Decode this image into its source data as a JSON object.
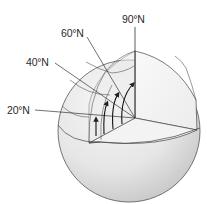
{
  "figure": {
    "labels": [
      {
        "id": "lat-90",
        "text": "90°N",
        "x": 122,
        "y": 14
      },
      {
        "id": "lat-60",
        "text": "60°N",
        "x": 61,
        "y": 28
      },
      {
        "id": "lat-40",
        "text": "40°N",
        "x": 26,
        "y": 57
      },
      {
        "id": "lat-20",
        "text": "20°N",
        "x": 7,
        "y": 105
      }
    ],
    "arrows_count": 4,
    "colors": {
      "sphere_light": "#f4f4f4",
      "sphere_shade": "#cfcfcf",
      "line": "#333333",
      "background": "#ffffff"
    }
  }
}
